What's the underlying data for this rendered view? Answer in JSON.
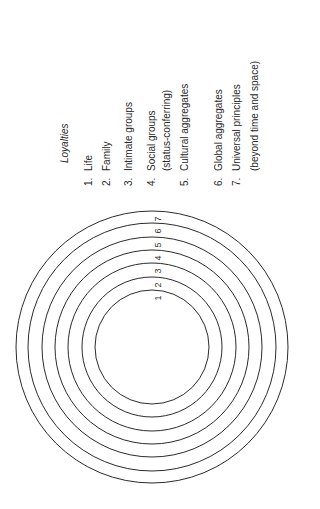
{
  "figure": {
    "heading": "Loyalties",
    "orientation": "rotated-90-counterclockwise",
    "ring_count": 7,
    "ring_labels": [
      "1",
      "2",
      "3",
      "4",
      "5",
      "6",
      "7"
    ],
    "line_color": "#2b2b2b",
    "text_color": "#2a2a2a"
  },
  "legend": {
    "items": [
      {
        "number": "1.",
        "lines": [
          "Life"
        ]
      },
      {
        "number": "2.",
        "lines": [
          "Family"
        ]
      },
      {
        "number": "3.",
        "lines": [
          "Intimate groups"
        ]
      },
      {
        "number": "4.",
        "lines": [
          "Social groups",
          "(status-conferring)"
        ]
      },
      {
        "number": "5.",
        "lines": [
          "Cultural aggregates"
        ]
      },
      {
        "number": "6.",
        "lines": [
          "Global aggregates"
        ]
      },
      {
        "number": "7.",
        "lines": [
          "Universal principles",
          "(beyond time and space)"
        ]
      }
    ]
  }
}
